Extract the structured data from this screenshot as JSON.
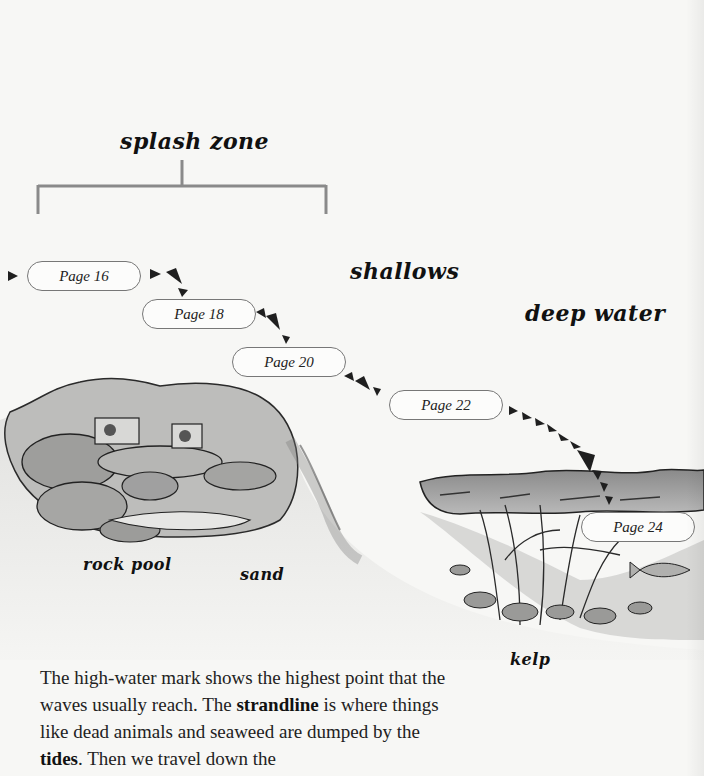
{
  "zones": {
    "splash_zone": "splash zone",
    "shallows": "shallows",
    "deep_water": "deep water"
  },
  "habitat_labels": {
    "rock_pool": "rock pool",
    "sand": "sand",
    "kelp": "kelp"
  },
  "page_links": [
    {
      "label": "Page 16"
    },
    {
      "label": "Page 18"
    },
    {
      "label": "Page 20"
    },
    {
      "label": "Page 22"
    },
    {
      "label": "Page 24"
    }
  ],
  "body": {
    "seg1": "The high-water mark shows the highest point that the waves usually reach. The ",
    "term1": "strandline",
    "seg2": " is where things like dead animals and seaweed are dumped by the ",
    "term2": "tides",
    "seg3": ". Then we travel down the"
  },
  "colors": {
    "bracket": "#8a8a8a",
    "ink": "#111111",
    "rock": "#a9a9a9",
    "water": "#8f8f8f"
  }
}
